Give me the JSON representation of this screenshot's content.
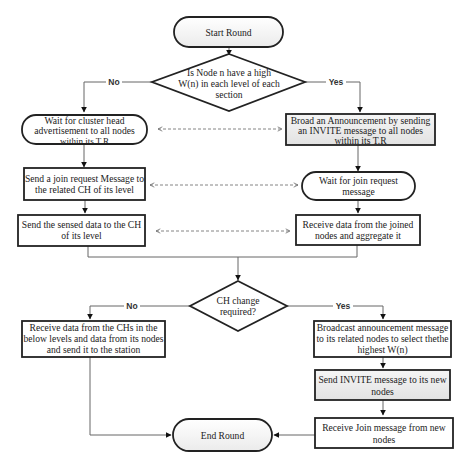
{
  "diagram": {
    "type": "flowchart",
    "nodes": {
      "start": {
        "label": [
          "Start Round"
        ],
        "shape": "terminator"
      },
      "decision1": {
        "label": [
          "Is Node n have a high",
          "W(n) in each level of each",
          "section"
        ],
        "shape": "diamond"
      },
      "wait_ch_adv": {
        "label": [
          "Wait for cluster head",
          "advertisement to all nodes",
          "within its T.R"
        ],
        "shape": "rounded"
      },
      "broadcast_invite": {
        "label": [
          "Broad an Announcement by sending",
          "an INVITE message to all nodes",
          "within its T.R"
        ],
        "shape": "rect-shaded"
      },
      "send_join_req": {
        "label": [
          "Send a join request Message to",
          "the related CH of its level"
        ],
        "shape": "rect"
      },
      "wait_join_req": {
        "label": [
          "Wait for join request",
          "message"
        ],
        "shape": "rounded"
      },
      "send_sensed": {
        "label": [
          "Send the sensed data to the CH",
          "of its level"
        ],
        "shape": "rect"
      },
      "receive_aggregate": {
        "label": [
          "Receive data from the joined",
          "nodes and aggregate it"
        ],
        "shape": "rect"
      },
      "decision2": {
        "label": [
          "CH change",
          "required?"
        ],
        "shape": "diamond"
      },
      "receive_chs": {
        "label": [
          "Receive data from the CHs in the",
          "below levels and data from its nodes",
          "and send it to the station"
        ],
        "shape": "rect"
      },
      "broadcast_announce": {
        "label": [
          "Broadcast announcement message",
          "to its related nodes to select thethe",
          "highest W(n)"
        ],
        "shape": "rect"
      },
      "send_invite_new": {
        "label": [
          "Send INVITE message to its new",
          "nodes"
        ],
        "shape": "rect-shaded"
      },
      "receive_join_new": {
        "label": [
          "Receive Join message from new",
          "nodes"
        ],
        "shape": "rect"
      },
      "end": {
        "label": [
          "End Round"
        ],
        "shape": "terminator"
      }
    },
    "edge_labels": {
      "d1_no": "No",
      "d1_yes": "Yes",
      "d2_no": "No",
      "d2_yes": "Yes"
    },
    "colors": {
      "border": "#222222",
      "line": "#666666",
      "shaded_fill": "#ececec",
      "terminator_fill": "#f4f4f4",
      "background": "#ffffff"
    }
  }
}
